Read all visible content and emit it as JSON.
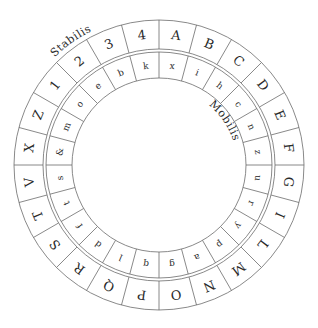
{
  "labels": {
    "outer": "Stabilis",
    "inner": "Mobilis"
  },
  "outer_ring": [
    "A",
    "B",
    "C",
    "D",
    "E",
    "F",
    "G",
    "I",
    "L",
    "M",
    "N",
    "O",
    "P",
    "Q",
    "R",
    "S",
    "T",
    "V",
    "X",
    "Z",
    "1",
    "2",
    "3",
    "4"
  ],
  "inner_ring": [
    "x",
    "i",
    "h",
    "c",
    "n",
    "z",
    "u",
    "r",
    "y",
    "p",
    "a",
    "g",
    "q",
    "l",
    "d",
    "f",
    "t",
    "s",
    "&",
    "m",
    "o",
    "e",
    "b",
    "k"
  ],
  "colors": {
    "line": "#6b6b6b",
    "text": "#2a2a2a",
    "background": "#ffffff"
  }
}
